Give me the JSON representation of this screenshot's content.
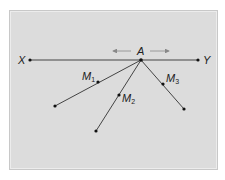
{
  "diagram": {
    "colors": {
      "background": "#ffffff",
      "frame": "#dcdcdc",
      "line": "#444444",
      "arrow": "#888888",
      "text": "#222222"
    },
    "points": {
      "X": {
        "label": "X",
        "x": 30,
        "y": 60
      },
      "A": {
        "label": "A",
        "x": 141,
        "y": 60
      },
      "Y": {
        "label": "Y",
        "x": 198,
        "y": 60
      },
      "E1": {
        "x": 55,
        "y": 106
      },
      "E2": {
        "x": 96,
        "y": 131
      },
      "E3": {
        "x": 184,
        "y": 109
      },
      "M1": {
        "label": "M",
        "sub": "1",
        "x": 98,
        "y": 82
      },
      "M2": {
        "label": "M",
        "sub": "2",
        "x": 119,
        "y": 95
      },
      "M3": {
        "label": "M",
        "sub": "3",
        "x": 163,
        "y": 84
      }
    },
    "labels": {
      "x": "X",
      "y": "Y",
      "a": "A",
      "m": "M",
      "m1_sub": "1",
      "m2_sub": "2",
      "m3_sub": "3"
    },
    "arrows": [
      {
        "direction": "left",
        "from": 131,
        "to": 113,
        "y": 51
      },
      {
        "direction": "right",
        "from": 150,
        "to": 169,
        "y": 51
      }
    ]
  }
}
